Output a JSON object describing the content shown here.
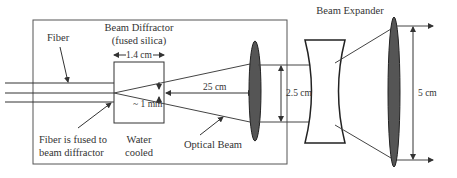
{
  "diagram": {
    "labels": {
      "fiber": "Fiber",
      "beam_diffractor_line1": "Beam Diffractor",
      "beam_diffractor_line2": "(fused silica)",
      "diffractor_width": "1.4 cm",
      "spot_size": "~ 1 mm",
      "distance": "25 cm",
      "fused_line1": "Fiber is fused to",
      "fused_line2": "beam diffractor",
      "water_line1": "Water",
      "water_line2": "cooled",
      "optical_beam": "Optical Beam",
      "beam_expander": "Beam Expander",
      "beam_width_in": "2.5 cm",
      "beam_width_out": "5 cm"
    },
    "components": [
      {
        "name": "fiber",
        "type": "fiber-bundle",
        "lines": 3
      },
      {
        "name": "beam-diffractor",
        "type": "block",
        "material": "fused silica",
        "width": "1.4 cm",
        "cooling": "Water cooled"
      },
      {
        "name": "collimating-lens",
        "type": "convex-lens"
      },
      {
        "name": "expander-concave-lens",
        "type": "concave-lens"
      },
      {
        "name": "expander-convex-lens",
        "type": "convex-lens"
      }
    ],
    "colors": {
      "line": "#333333",
      "lens_fill": "#555555",
      "box_stroke": "#555555"
    }
  }
}
